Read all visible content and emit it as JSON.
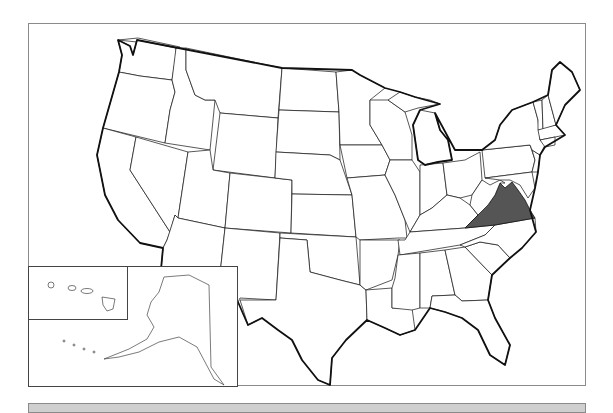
{
  "map": {
    "title": "",
    "type": "US states outline map",
    "highlighted_state": "Virginia",
    "highlight_color": "#555555",
    "base_fill": "#ffffff",
    "border_color": "#111111",
    "insets": [
      "Hawaii",
      "Alaska"
    ]
  },
  "footer_bar": {
    "color": "#cfcfcf",
    "text": ""
  }
}
